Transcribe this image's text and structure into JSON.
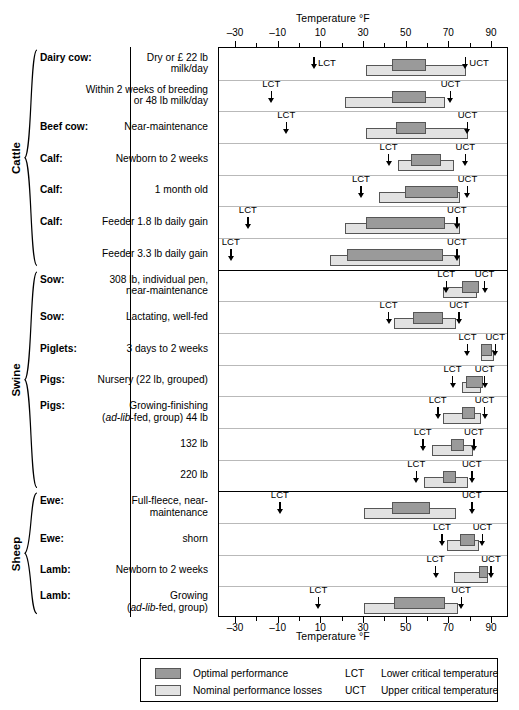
{
  "chart": {
    "axis_title_top": "Temperature °F",
    "axis_title_bottom": "Temperature °F"
  },
  "chart_data": {
    "type": "bar",
    "orientation": "horizontal",
    "title": "",
    "xlabel": "Temperature °F",
    "ylabel": "",
    "xlim": [
      -38,
      98
    ],
    "xticks_major": [
      -30,
      -10,
      10,
      30,
      50,
      70,
      90
    ],
    "xticks_minor": [
      -20,
      0,
      20,
      40,
      60,
      80
    ],
    "grid": false,
    "legend_position": "bottom",
    "series": [
      {
        "name": "Optimal performance",
        "color": "#9a9a9a"
      },
      {
        "name": "Nominal performance losses",
        "color": "#e2e2e2"
      }
    ],
    "annotations": [
      {
        "abbr": "LCT",
        "meaning": "Lower critical temperature"
      },
      {
        "abbr": "UCT",
        "meaning": "Upper critical temperature"
      }
    ],
    "groups": [
      {
        "name": "Cattle",
        "rows": [
          {
            "bold": "Dairy cow:",
            "rest": "Dry or £ 22 lb\nmilk/day",
            "nominal": [
              31,
              78
            ],
            "optimal": [
              43,
              59
            ],
            "lct": 7,
            "uct": 78,
            "lct_label_side": "right",
            "uct_label_side": "right",
            "arrow_inline": true
          },
          {
            "bold": "",
            "rest": "Within 2 weeks of breeding\nor  48 lb milk/day",
            "nominal": [
              21,
              68
            ],
            "optimal": [
              43,
              59
            ],
            "lct": -13,
            "uct": 71,
            "lct_label_side": "above",
            "uct_label_side": "above",
            "arrow_inline": false
          },
          {
            "bold": "Beef cow:",
            "rest": " Near-maintenance",
            "nominal": [
              31,
              79
            ],
            "optimal": [
              45,
              59
            ],
            "lct": -6,
            "uct": 79,
            "lct_label_side": "above",
            "uct_label_side": "above",
            "arrow_inline": false
          },
          {
            "bold": "Calf:",
            "rest": "Newborn to 2 weeks",
            "nominal": [
              46,
              72
            ],
            "optimal": [
              52,
              66
            ],
            "lct": 42,
            "uct": 78,
            "lct_label_side": "above",
            "uct_label_side": "above",
            "arrow_inline": false
          },
          {
            "bold": "Calf:",
            "rest": "1 month old",
            "nominal": [
              37,
              75
            ],
            "optimal": [
              49,
              74
            ],
            "lct": 29,
            "uct": 79,
            "lct_label_side": "above",
            "uct_label_side": "above",
            "arrow_inline": false
          },
          {
            "bold": "Calf:",
            "rest": "Feeder 1.8 lb daily gain",
            "nominal": [
              21,
              75
            ],
            "optimal": [
              31,
              68
            ],
            "lct": -24,
            "uct": 74,
            "lct_label_side": "above",
            "uct_label_side": "above",
            "arrow_inline": false
          },
          {
            "bold": "",
            "rest": "Feeder 3.3 lb daily gain",
            "nominal": [
              14,
              75
            ],
            "optimal": [
              22,
              67
            ],
            "lct": -32,
            "uct": 74,
            "lct_label_side": "above",
            "uct_label_side": "above",
            "arrow_inline": false
          }
        ]
      },
      {
        "name": "Swine",
        "rows": [
          {
            "bold": "Sow:",
            "rest": "308 lb, individual pen,\nnear-maintenance",
            "nominal": [
              67,
              83
            ],
            "optimal": [
              76,
              84
            ],
            "lct": 69,
            "uct": 87,
            "lct_label_side": "above",
            "uct_label_side": "above",
            "arrow_inline": false
          },
          {
            "bold": "Sow:",
            "rest": "Lactating, well-fed",
            "nominal": [
              44,
              73
            ],
            "optimal": [
              53,
              67
            ],
            "lct": 42,
            "uct": 75,
            "lct_label_side": "above",
            "uct_label_side": "above",
            "arrow_inline": false
          },
          {
            "bold": "Piglets:",
            "rest": "3 days to 2 weeks",
            "nominal": [
              85,
              91
            ],
            "optimal": [
              85,
              90
            ],
            "lct": 79,
            "uct": 92,
            "lct_label_side": "above",
            "uct_label_side": "above",
            "arrow_inline": false
          },
          {
            "bold": "Pigs:",
            "rest": " Nursery (22 lb, grouped)",
            "nominal": [
              76,
              85
            ],
            "optimal": [
              78,
              86
            ],
            "lct": 72,
            "uct": 87,
            "lct_label_side": "above",
            "uct_label_side": "above",
            "arrow_inline": false
          },
          {
            "bold": "Pigs:",
            "rest": " Growing-finishing\n(ad-lib-fed, group) 44 lb",
            "nominal": [
              67,
              85
            ],
            "optimal": [
              76,
              82
            ],
            "lct": 65,
            "uct": 87,
            "lct_label_side": "above",
            "uct_label_side": "above",
            "arrow_inline": false
          },
          {
            "bold": "",
            "rest": "132 lb",
            "nominal": [
              62,
              81
            ],
            "optimal": [
              71,
              77
            ],
            "lct": 58,
            "uct": 82,
            "lct_label_side": "above",
            "uct_label_side": "above",
            "arrow_inline": false
          },
          {
            "bold": "",
            "rest": "220 lb",
            "nominal": [
              58,
              79
            ],
            "optimal": [
              67,
              73
            ],
            "lct": 55,
            "uct": 81,
            "lct_label_side": "above",
            "uct_label_side": "above",
            "arrow_inline": false
          }
        ]
      },
      {
        "name": "Sheep",
        "rows": [
          {
            "bold": "Ewe:",
            "rest": "Full-fleece, near-\nmaintenance",
            "nominal": [
              30,
              73
            ],
            "optimal": [
              43,
              61
            ],
            "lct": -9,
            "uct": 81,
            "lct_label_side": "above",
            "uct_label_side": "above",
            "arrow_inline": false
          },
          {
            "bold": "Ewe:",
            "rest": "shorn",
            "nominal": [
              69,
              84
            ],
            "optimal": [
              75,
              82
            ],
            "lct": 67,
            "uct": 86,
            "lct_label_side": "above",
            "uct_label_side": "above",
            "arrow_inline": false
          },
          {
            "bold": "Lamb:",
            "rest": "Newborn to 2 weeks",
            "nominal": [
              72,
              88
            ],
            "optimal": [
              84,
              88
            ],
            "lct": 64,
            "uct": 90,
            "lct_label_side": "above",
            "uct_label_side": "above",
            "arrow_inline": false
          },
          {
            "bold": "Lamb:",
            "rest": "Growing\n(ad-lib-fed, group)",
            "nominal": [
              30,
              74
            ],
            "optimal": [
              44,
              68
            ],
            "lct": 9,
            "uct": 76,
            "lct_label_side": "above",
            "uct_label_side": "above",
            "arrow_inline": false
          }
        ]
      }
    ]
  },
  "legend": {
    "items": [
      {
        "swatch": "#9a9a9a",
        "label": "Optimal performance"
      },
      {
        "swatch": "#e2e2e2",
        "label": "Nominal performance losses"
      }
    ],
    "notes": [
      {
        "abbr": "LCT",
        "text": "Lower critical temperature"
      },
      {
        "abbr": "UCT",
        "text": "Upper critical temperature"
      }
    ]
  }
}
